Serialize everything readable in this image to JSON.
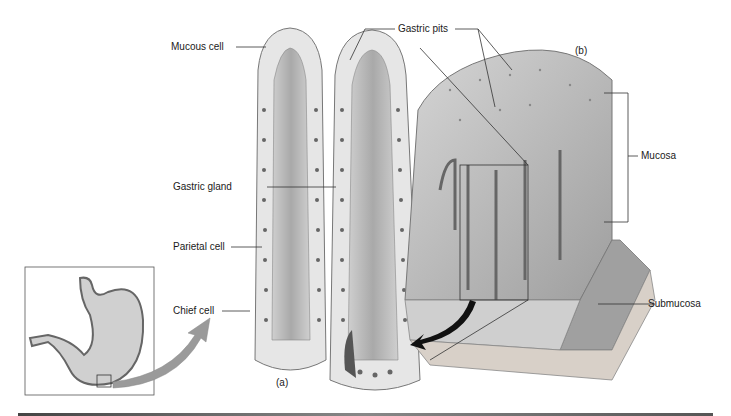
{
  "figure": {
    "panel_labels": {
      "a": "(a)",
      "b": "(b)"
    },
    "labels": {
      "mucous_cell": "Mucous cell",
      "gastric_pits": "Gastric pits",
      "gastric_gland": "Gastric gland",
      "parietal_cell": "Parietal cell",
      "chief_cell": "Chief cell",
      "mucosa": "Mucosa",
      "submucosa": "Submucosa"
    },
    "colors": {
      "tissue": "#bdbdbd",
      "tissue_light": "#d9d9d9",
      "tissue_dark": "#8a8a8a",
      "line": "#333333",
      "arrow_gray": "#9a9a9a",
      "arrow_black": "#111111",
      "rule": "#555555"
    }
  }
}
